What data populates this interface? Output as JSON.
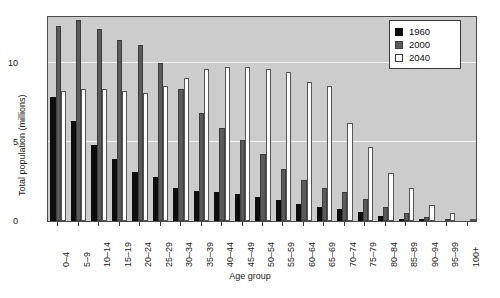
{
  "chart_data": {
    "type": "bar",
    "title": "",
    "xlabel": "Age group",
    "ylabel": "Total population (millions)",
    "ylim": [
      0,
      13
    ],
    "yticks": [
      0,
      5,
      10
    ],
    "ytick_labels": [
      "0",
      "5",
      "10"
    ],
    "grid": true,
    "legend_position": "top-right",
    "categories": [
      "0–4",
      "5–9",
      "10–14",
      "15–19",
      "20–24",
      "25–29",
      "30–34",
      "35–39",
      "40–44",
      "45–49",
      "50–54",
      "55–59",
      "60–64",
      "65–69",
      "70–74",
      "75–79",
      "80–84",
      "85–89",
      "90–94",
      "95–99",
      "100+"
    ],
    "series": [
      {
        "name": "1960",
        "color": "#0d0d0d",
        "values": [
          7.8,
          6.3,
          4.8,
          3.9,
          3.1,
          2.8,
          2.1,
          1.9,
          1.8,
          1.7,
          1.5,
          1.3,
          1.1,
          0.9,
          0.75,
          0.55,
          0.3,
          0.15,
          0.05,
          0.02,
          0.0
        ]
      },
      {
        "name": "2000",
        "color": "#5a5a5a",
        "values": [
          12.3,
          12.7,
          12.1,
          11.4,
          11.1,
          10.0,
          8.3,
          6.8,
          5.9,
          5.1,
          4.2,
          3.3,
          2.6,
          2.1,
          1.8,
          1.4,
          0.9,
          0.5,
          0.25,
          0.08,
          0.02
        ]
      },
      {
        "name": "2040",
        "color": "#ffffff",
        "values": [
          8.2,
          8.3,
          8.3,
          8.2,
          8.1,
          8.5,
          9.0,
          9.6,
          9.7,
          9.7,
          9.6,
          9.4,
          8.8,
          8.5,
          6.2,
          4.7,
          3.0,
          2.1,
          1.0,
          0.5,
          0.15
        ]
      }
    ]
  },
  "legend": {
    "entries": [
      {
        "label": "1960",
        "swatch": "y1960"
      },
      {
        "label": "2000",
        "swatch": "y2000"
      },
      {
        "label": "2040",
        "swatch": "y2040"
      }
    ]
  }
}
